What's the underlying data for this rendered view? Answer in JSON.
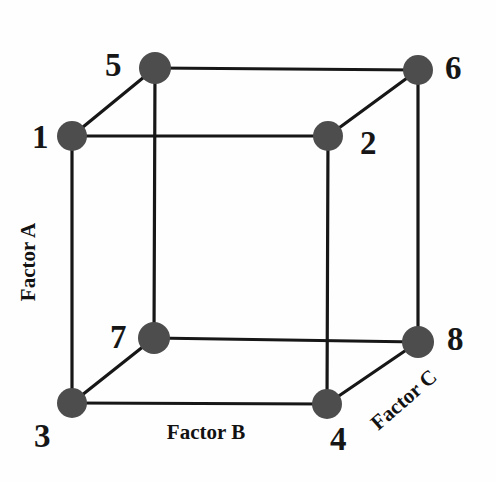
{
  "figure": {
    "background_color": "#fefefe",
    "node_color": "#4d4d4d",
    "edge_color": "#171717",
    "label_color": "#161616"
  },
  "nodes": [
    {
      "id": "1",
      "label": "1",
      "cx": 72,
      "cy": 136,
      "r": 15,
      "label_x": 40,
      "label_y": 137
    },
    {
      "id": "2",
      "label": "2",
      "cx": 328,
      "cy": 136,
      "r": 15,
      "label_x": 368,
      "label_y": 143
    },
    {
      "id": "3",
      "label": "3",
      "cx": 72,
      "cy": 403,
      "r": 15,
      "label_x": 42,
      "label_y": 436
    },
    {
      "id": "4",
      "label": "4",
      "cx": 327,
      "cy": 404,
      "r": 15,
      "label_x": 338,
      "label_y": 439
    },
    {
      "id": "5",
      "label": "5",
      "cx": 155,
      "cy": 68,
      "r": 16,
      "label_x": 113,
      "label_y": 65
    },
    {
      "id": "6",
      "label": "6",
      "cx": 418,
      "cy": 70,
      "r": 15,
      "label_x": 453,
      "label_y": 68
    },
    {
      "id": "7",
      "label": "7",
      "cx": 154,
      "cy": 338,
      "r": 16,
      "label_x": 118,
      "label_y": 337
    },
    {
      "id": "8",
      "label": "8",
      "cx": 418,
      "cy": 342,
      "r": 16,
      "label_x": 455,
      "label_y": 339
    }
  ],
  "edges": [
    {
      "name": "edge-1-2",
      "from": "1",
      "to": "2"
    },
    {
      "name": "edge-1-3",
      "from": "1",
      "to": "3"
    },
    {
      "name": "edge-1-5",
      "from": "1",
      "to": "5"
    },
    {
      "name": "edge-2-4",
      "from": "2",
      "to": "4"
    },
    {
      "name": "edge-2-6",
      "from": "2",
      "to": "6"
    },
    {
      "name": "edge-3-4",
      "from": "3",
      "to": "4"
    },
    {
      "name": "edge-3-7",
      "from": "3",
      "to": "7"
    },
    {
      "name": "edge-4-8",
      "from": "4",
      "to": "8"
    },
    {
      "name": "edge-5-6",
      "from": "5",
      "to": "6"
    },
    {
      "name": "edge-5-7",
      "from": "5",
      "to": "7"
    },
    {
      "name": "edge-6-8",
      "from": "6",
      "to": "8"
    },
    {
      "name": "edge-7-8",
      "from": "7",
      "to": "8"
    }
  ],
  "axes": {
    "factor_a": {
      "label": "Factor A",
      "x": 28,
      "y": 262,
      "rotation": -90
    },
    "factor_b": {
      "label": "Factor B",
      "x": 206,
      "y": 432,
      "rotation": 0
    },
    "factor_c": {
      "label": "Factor C",
      "x": 404,
      "y": 400,
      "rotation": -41
    }
  },
  "chart_data": {
    "type": "diagram",
    "vertices": [
      "1",
      "2",
      "3",
      "4",
      "5",
      "6",
      "7",
      "8"
    ],
    "axis_labels": [
      "Factor A",
      "Factor B",
      "Factor C"
    ],
    "edge_count": 12,
    "vertex_count": 8
  }
}
